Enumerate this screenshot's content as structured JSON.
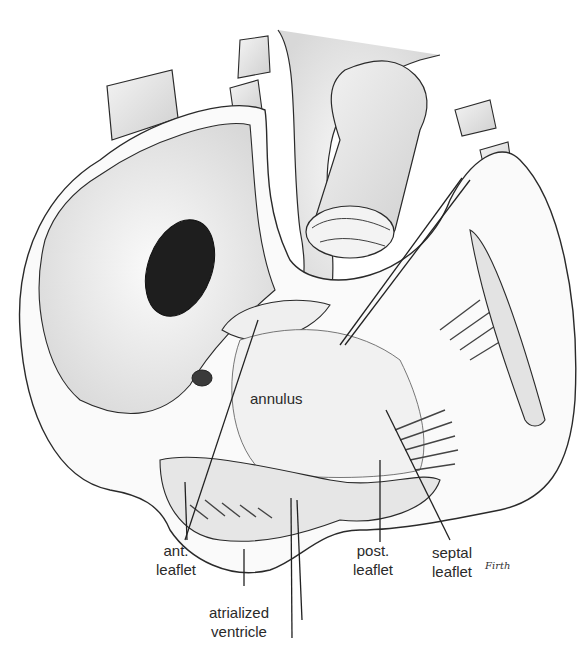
{
  "figure": {
    "colors": {
      "background": "#ffffff",
      "ink": "#2a2a2a",
      "shade": "#bdbdbd",
      "dark": "#1e1e1e"
    }
  },
  "labels": {
    "annulus": "annulus",
    "ant_leaflet": "ant.\nleaflet",
    "post_leaflet": "post.\nleaflet",
    "septal_leaflet": "septal\nleaflet",
    "atrialized_ventricle": "atrialized\nventricle"
  },
  "signature": "Firth"
}
